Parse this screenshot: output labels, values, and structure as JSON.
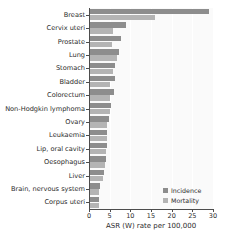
{
  "chart_data": {
    "type": "bar",
    "orientation": "horizontal",
    "title": "",
    "xlabel": "ASR (W) rate per 100,000",
    "ylabel": "",
    "xlim": [
      0,
      30
    ],
    "xticks": [
      0,
      5,
      10,
      15,
      20,
      25,
      30
    ],
    "grid": true,
    "grid_axis": "x",
    "legend_position": "bottom-right",
    "categories": [
      "Breast",
      "Cervix uteri",
      "Prostate",
      "Lung",
      "Stomach",
      "Bladder",
      "Colorectum",
      "Non-Hodgkin lymphoma",
      "Ovary",
      "Leukaemia",
      "Lip, oral cavity",
      "Oesophagus",
      "Liver",
      "Brain, nervous system",
      "Corpus uteri"
    ],
    "series": [
      {
        "name": "Incidence",
        "color": "#8d8d8d",
        "values": [
          29.0,
          9.0,
          7.7,
          7.3,
          6.3,
          6.2,
          6.0,
          5.3,
          4.9,
          4.4,
          4.4,
          4.2,
          3.7,
          2.7,
          2.4
        ]
      },
      {
        "name": "Mortality",
        "color": "#b4b4b4",
        "values": [
          16.0,
          5.9,
          5.5,
          6.8,
          5.9,
          5.2,
          5.0,
          5.0,
          4.4,
          4.3,
          4.2,
          3.9,
          3.5,
          2.4,
          2.3
        ]
      }
    ]
  },
  "legend": {
    "items": [
      {
        "label": "Incidence",
        "key": "incidence"
      },
      {
        "label": "Mortality",
        "key": "mortality"
      }
    ]
  },
  "colors": {
    "incidence": "#8d8d8d",
    "mortality": "#b4b4b4",
    "axis": "#4d4d4d",
    "plot_background": "#fafafa",
    "grid": "#ffffff",
    "text": "#2b2b2b"
  }
}
